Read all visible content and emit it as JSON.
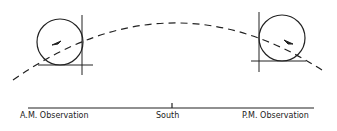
{
  "diagram": {
    "labels": {
      "am": "A.M. Observation",
      "south": "South",
      "pm": "P.M. Observation"
    },
    "colors": {
      "stroke": "#222222",
      "background": "#ffffff"
    }
  }
}
